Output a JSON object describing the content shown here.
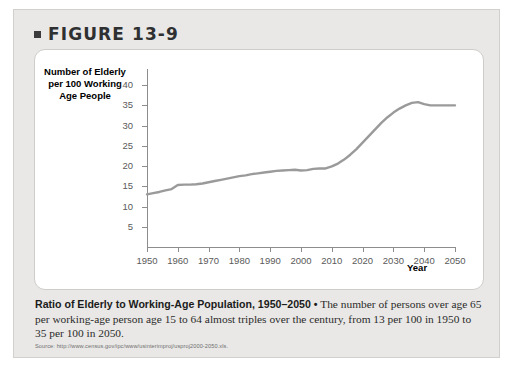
{
  "figure": {
    "bullet_icon": "square-bullet-icon",
    "heading": "FIGURE 13-9"
  },
  "chart_data": {
    "type": "line",
    "title": "",
    "xlabel": "Year",
    "ylabel": "Number of Elderly per 100 Working Age People",
    "xlim": [
      1950,
      2050
    ],
    "ylim": [
      0,
      42
    ],
    "grid": false,
    "legend": "none",
    "y_ticks": [
      5,
      10,
      15,
      20,
      25,
      30,
      35,
      40
    ],
    "x_ticks": [
      1950,
      1960,
      1970,
      1980,
      1990,
      2000,
      2010,
      2020,
      2030,
      2040,
      2050
    ],
    "series": [
      {
        "name": "Ratio of elderly to working-age population",
        "color": "#9a9a9a",
        "x": [
          1950,
          1952,
          1954,
          1956,
          1958,
          1960,
          1962,
          1964,
          1966,
          1968,
          1970,
          1972,
          1974,
          1976,
          1978,
          1980,
          1982,
          1984,
          1986,
          1988,
          1990,
          1992,
          1994,
          1996,
          1998,
          2000,
          2002,
          2004,
          2006,
          2008,
          2010,
          2012,
          2014,
          2016,
          2018,
          2020,
          2022,
          2024,
          2026,
          2028,
          2030,
          2032,
          2034,
          2036,
          2038,
          2040,
          2042,
          2044,
          2046,
          2048,
          2050
        ],
        "y": [
          13.0,
          13.3,
          13.6,
          14.0,
          14.3,
          15.3,
          15.4,
          15.4,
          15.5,
          15.7,
          16.0,
          16.3,
          16.6,
          16.9,
          17.2,
          17.5,
          17.7,
          18.0,
          18.2,
          18.4,
          18.6,
          18.8,
          18.9,
          19.0,
          19.1,
          18.9,
          19.0,
          19.3,
          19.4,
          19.4,
          19.9,
          20.6,
          21.6,
          22.8,
          24.2,
          25.8,
          27.4,
          29.0,
          30.6,
          32.0,
          33.2,
          34.2,
          35.0,
          35.6,
          35.8,
          35.3,
          35.0,
          35.0,
          35.0,
          35.0,
          35.0
        ]
      }
    ],
    "annotations": []
  },
  "caption": {
    "lead": "Ratio of Elderly to Working-Age Population, 1950–2050 •",
    "body": " The number of persons over age 65 per working-age person age 15 to 64 almost triples over the century, from 13 per 100 in 1950 to 35 per 100 in 2050."
  },
  "source": {
    "text": "Source: http://www.census.gov/ipc/www/usinterimproj/usproj2000-2050.xls."
  }
}
